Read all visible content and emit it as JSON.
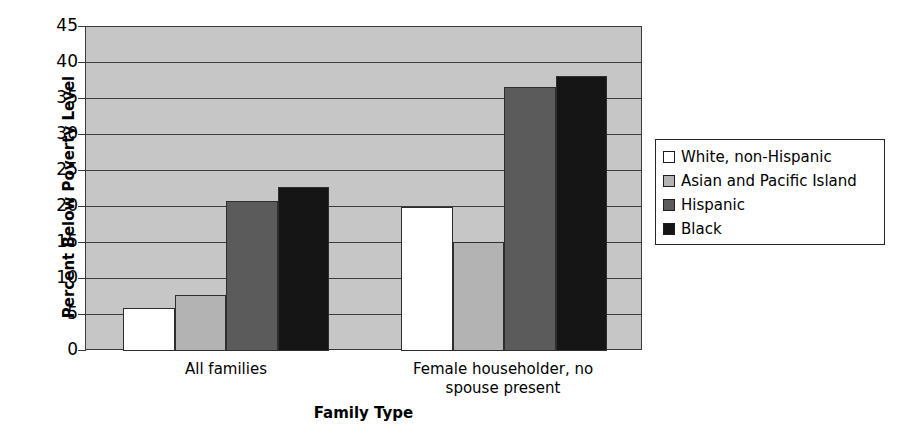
{
  "chart_data": {
    "type": "bar",
    "title": "",
    "xlabel": "Family Type",
    "ylabel": "Percent Below Poverty Level",
    "categories": [
      "All families",
      "Female householder, no spouse present"
    ],
    "series": [
      {
        "name": "White, non-Hispanic",
        "color": "#ffffff",
        "values": [
          6.0,
          20.0
        ]
      },
      {
        "name": "Asian and Pacific Island",
        "color": "#b3b3b3",
        "values": [
          7.8,
          15.2
        ]
      },
      {
        "name": "Hispanic",
        "color": "#5b5b5b",
        "values": [
          20.8,
          36.6
        ]
      },
      {
        "name": "Black",
        "color": "#151515",
        "values": [
          22.8,
          38.2
        ]
      }
    ],
    "ylim": [
      0,
      45
    ],
    "ytick_step": 5,
    "yticks": [
      "45",
      "40",
      "35",
      "30",
      "25",
      "20",
      "15",
      "10",
      "5",
      "0"
    ],
    "grid": true,
    "legend_position": "right",
    "plot_background": "#c6c6c6"
  },
  "category_label_lines": [
    [
      "All families"
    ],
    [
      "Female householder, no",
      "spouse present"
    ]
  ]
}
